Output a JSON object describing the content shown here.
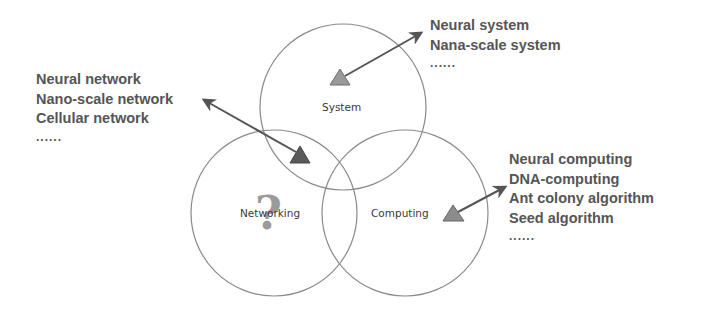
{
  "diagram": {
    "circles": [
      {
        "id": "system",
        "label": "System",
        "cx": 343,
        "cy": 107,
        "r": 83
      },
      {
        "id": "networking",
        "label": "Networking",
        "cx": 274,
        "cy": 213,
        "r": 83
      },
      {
        "id": "computing",
        "label": "Computing",
        "cx": 405,
        "cy": 213,
        "r": 83
      }
    ],
    "colors": {
      "circle_stroke": "#8a8a8a",
      "arrow": "#555555",
      "triangle_system": "#9a9a9a",
      "triangle_network": "#5a5a5a",
      "triangle_computing": "#8c8c8c",
      "question_mark": "#9a9a9a",
      "text": "#555555"
    },
    "question_mark": "?",
    "lists": {
      "networking": {
        "items": [
          "Neural network",
          "Nano-scale network",
          "Cellular network"
        ],
        "more": "......"
      },
      "system": {
        "items": [
          "Neural system",
          "Nana-scale system"
        ],
        "more": "......"
      },
      "computing": {
        "items": [
          "Neural computing",
          "DNA-computing",
          "Ant colony algorithm",
          "Seed algorithm"
        ],
        "more": "......"
      }
    }
  }
}
